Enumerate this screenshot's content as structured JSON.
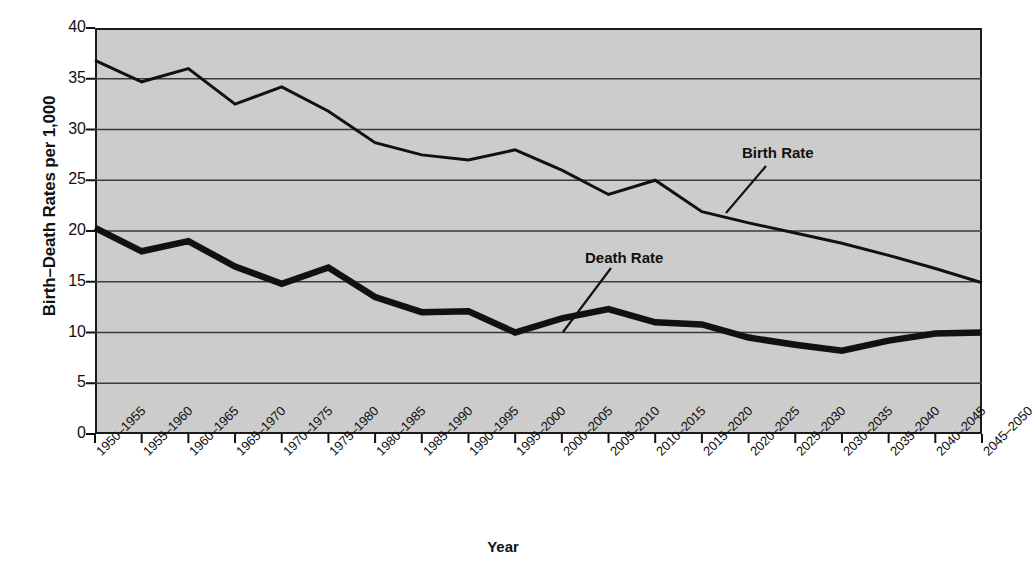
{
  "chart_data": {
    "type": "line",
    "title": "",
    "xlabel": "Year",
    "ylabel": "Birth–Death Rates per 1,000",
    "ylim": [
      0,
      40
    ],
    "ytick_step": 5,
    "grid": true,
    "legend_position": "inline-annotations",
    "background_color": "#cccccc",
    "line_color": "#111111",
    "categories": [
      "1950–1955",
      "1955–1960",
      "1960–1965",
      "1965–1970",
      "1970–1975",
      "1975–1980",
      "1980–1985",
      "1985–1990",
      "1990–1995",
      "1995–2000",
      "2000–2005",
      "2005–2010",
      "2010–2015",
      "2015–2020",
      "2020–2025",
      "2025–2030",
      "2030–2035",
      "2035–2040",
      "2040–2045",
      "2045–2050"
    ],
    "yticks": [
      0,
      5,
      10,
      15,
      20,
      25,
      30,
      35,
      40
    ],
    "series": [
      {
        "name": "Birth Rate",
        "values": [
          36.8,
          34.7,
          36.0,
          32.5,
          34.2,
          31.8,
          28.7,
          27.5,
          27.0,
          28.0,
          26.0,
          23.6,
          25.0,
          21.9,
          20.8,
          19.8,
          18.8,
          17.6,
          16.3,
          14.9
        ],
        "label_x": 742,
        "label_y": 144
      },
      {
        "name": "Death Rate",
        "values": [
          20.3,
          18.0,
          19.0,
          16.5,
          14.8,
          16.4,
          13.5,
          12.0,
          12.1,
          10.0,
          11.4,
          12.3,
          11.0,
          10.8,
          9.5,
          8.8,
          8.2,
          9.2,
          9.9,
          10.0
        ],
        "label_x": 585,
        "label_y": 249
      }
    ]
  },
  "axes": {
    "y_title": "Birth–Death Rates per 1,000",
    "x_title": "Year"
  }
}
